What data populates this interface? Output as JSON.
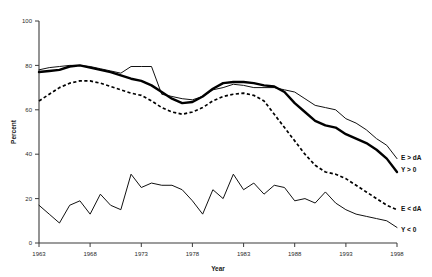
{
  "chart_data": {
    "type": "line",
    "title": "",
    "xlabel": "Year",
    "ylabel": "Percent",
    "xlim": [
      1963,
      1998
    ],
    "ylim": [
      0,
      100
    ],
    "grid": false,
    "legend_position": "right-inline",
    "xticks": [
      "1963",
      "1968",
      "1973",
      "1978",
      "1983",
      "1988",
      "1993",
      "1998"
    ],
    "yticks": [
      "0",
      "20",
      "40",
      "60",
      "80",
      "100"
    ],
    "x": [
      1963,
      1964,
      1965,
      1966,
      1967,
      1968,
      1969,
      1970,
      1971,
      1972,
      1973,
      1974,
      1975,
      1976,
      1977,
      1978,
      1979,
      1980,
      1981,
      1982,
      1983,
      1984,
      1985,
      1986,
      1987,
      1988,
      1989,
      1990,
      1991,
      1992,
      1993,
      1994,
      1995,
      1996,
      1997,
      1998
    ],
    "series": [
      {
        "name": "E > dA",
        "style": "thin-solid",
        "color": "#111111",
        "values": [
          78,
          79,
          79.5,
          80,
          80,
          79.5,
          78.5,
          77.5,
          76.5,
          79.5,
          79.5,
          79.5,
          67,
          66,
          65,
          64.5,
          66,
          69,
          70,
          71.5,
          71,
          70,
          70,
          70,
          69,
          68,
          65,
          62,
          61,
          60,
          56,
          54,
          51,
          47,
          44,
          38
        ]
      },
      {
        "name": "Y > 0",
        "style": "thick-solid",
        "color": "#000000",
        "values": [
          77,
          77.5,
          78,
          79.5,
          80,
          79,
          78,
          77,
          75.5,
          74,
          73,
          71,
          68,
          65,
          63,
          63.5,
          66,
          69.5,
          72,
          72.5,
          72.5,
          72,
          71,
          70.5,
          68,
          63,
          59,
          55,
          53,
          52,
          49,
          47,
          45,
          42,
          38,
          32
        ]
      },
      {
        "name": "E < dA",
        "style": "dashed",
        "color": "#000000",
        "values": [
          64,
          67,
          70,
          72,
          73,
          73,
          72,
          70.5,
          69,
          67.5,
          66.5,
          64,
          61,
          59,
          58,
          59,
          61,
          64,
          66,
          67,
          67.5,
          66.5,
          64,
          58,
          52,
          46,
          40,
          35,
          32,
          31,
          29,
          26,
          23,
          20,
          17,
          15
        ]
      },
      {
        "name": "Y < 0",
        "style": "thin-solid",
        "color": "#111111",
        "values": [
          17,
          13,
          9,
          17,
          19,
          13,
          22,
          17,
          15,
          31,
          25,
          27,
          26,
          26,
          24,
          19,
          13,
          24,
          20,
          31,
          24,
          27,
          22,
          26,
          25,
          19,
          20,
          18,
          23,
          18,
          15,
          13,
          12,
          11,
          10,
          7
        ]
      }
    ]
  },
  "legend": {
    "items": [
      {
        "label": "E > dA"
      },
      {
        "label": "Y > 0"
      },
      {
        "label": "E < dA"
      },
      {
        "label": "Y < 0"
      }
    ]
  }
}
